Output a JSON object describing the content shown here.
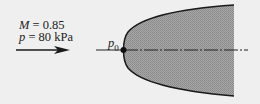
{
  "diagram": {
    "flow_conditions": {
      "mach_symbol": "M",
      "mach_value": "= 0.85",
      "pressure_symbol": "p",
      "pressure_value": "= 80 kPa"
    },
    "stagnation_label": {
      "symbol": "p",
      "subscript": "0"
    },
    "elements": {
      "flow_arrow": "free-stream flow direction arrow pointing right",
      "body": "blunt-nosed axisymmetric body (shaded, parabolic profile)",
      "centerline": "dash-dot axis line through body",
      "stagnation_point": "dot at nose"
    },
    "colors": {
      "background": "#efefef",
      "body_fill": "#9c9c9c",
      "outline": "#1a1a1a"
    }
  }
}
